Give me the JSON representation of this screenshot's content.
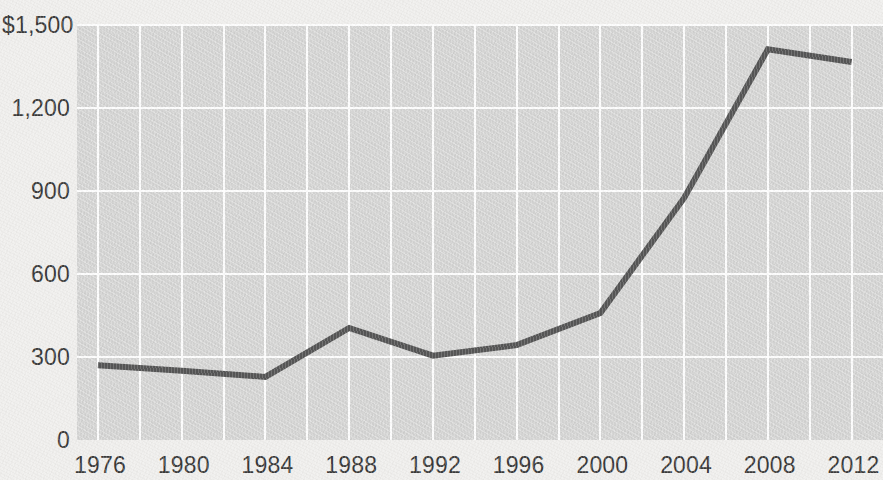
{
  "chart_data": {
    "type": "line",
    "title": "",
    "subtitle": "",
    "xlabel": "",
    "ylabel": "",
    "x": [
      1976,
      1980,
      1984,
      1988,
      1992,
      1996,
      2000,
      2004,
      2008,
      2012
    ],
    "values": [
      270,
      250,
      228,
      405,
      305,
      343,
      459,
      875,
      1412,
      1366
    ],
    "series": [
      {
        "name": "",
        "values": [
          270,
          250,
          228,
          405,
          305,
          343,
          459,
          875,
          1412,
          1366
        ]
      }
    ],
    "xlim": [
      1975,
      2013.5
    ],
    "ylim": [
      0,
      1500
    ],
    "y_ticks": [
      0,
      300,
      600,
      900,
      1200,
      1500
    ],
    "y_tick_labels": [
      "0",
      "300",
      "600",
      "900",
      "1,200",
      "$1,500"
    ],
    "x_ticks": [
      1976,
      1980,
      1984,
      1988,
      1992,
      1996,
      2000,
      2004,
      2008,
      2012
    ],
    "x_tick_labels": [
      "1976",
      "1980",
      "1984",
      "1988",
      "1992",
      "1996",
      "2000",
      "2004",
      "2008",
      "2012"
    ],
    "x_minor_gridlines": [
      1978,
      1982,
      1986,
      1990,
      1994,
      1998,
      2002,
      2006,
      2010
    ],
    "grid": true,
    "grid_color": "#fdfdfd",
    "legend": null,
    "legend_position": "none",
    "line_color": "#565656",
    "line_width": 6,
    "plot_background": "#d5d5d4",
    "page_background": "#f0efed",
    "text_color": "#3b3b3b",
    "currency_prefix": "$",
    "annotations": []
  }
}
